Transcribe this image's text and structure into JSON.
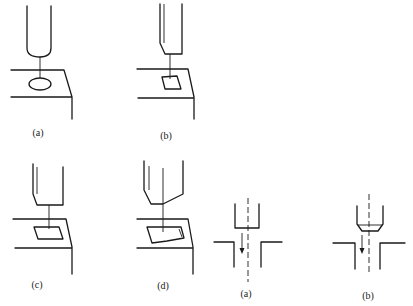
{
  "figure": {
    "panels": [
      {
        "id": "a",
        "label": "(a)",
        "description": "Round electrode above workpiece, producing circular hole"
      },
      {
        "id": "b",
        "label": "(b)",
        "description": "Electrode with chamfered edge producing square hole"
      },
      {
        "id": "c",
        "label": "(c)",
        "description": "Electrode producing parallelogram hole"
      },
      {
        "id": "d",
        "label": "(d)",
        "description": "Angled-tip electrode producing irregular pentagonal hole"
      }
    ],
    "sections": [
      {
        "id": "sec-a",
        "label": "(a)",
        "description": "Cross-section: straight electrode entering hole, feed arrow down"
      },
      {
        "id": "sec-b",
        "label": "(b)",
        "description": "Cross-section: chamfered electrode entering hole, feed arrow down"
      }
    ]
  }
}
